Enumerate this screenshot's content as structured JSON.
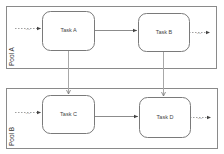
{
  "pools": [
    {
      "id": "pool-a",
      "label": "Pool A",
      "x": 6,
      "y": 6,
      "w": 210,
      "h": 62
    },
    {
      "id": "pool-b",
      "label": "Pool B",
      "x": 6,
      "y": 88,
      "w": 211,
      "h": 60
    }
  ],
  "tasks": [
    {
      "id": "task-a",
      "label": "Task A",
      "x": 42,
      "y": 11,
      "w": 52,
      "h": 39
    },
    {
      "id": "task-b",
      "label": "Task B",
      "x": 138,
      "y": 13,
      "w": 51,
      "h": 38
    },
    {
      "id": "task-c",
      "label": "Task C",
      "x": 42,
      "y": 95,
      "w": 52,
      "h": 38
    },
    {
      "id": "task-d",
      "label": "Task D",
      "x": 139,
      "y": 97,
      "w": 51,
      "h": 40
    }
  ],
  "ellipsis": "...",
  "colors": {
    "pool_border": "#8a8a8a",
    "task_border": "#7a7a7a",
    "arrow": "#8c8c8c",
    "text": "#444444"
  }
}
